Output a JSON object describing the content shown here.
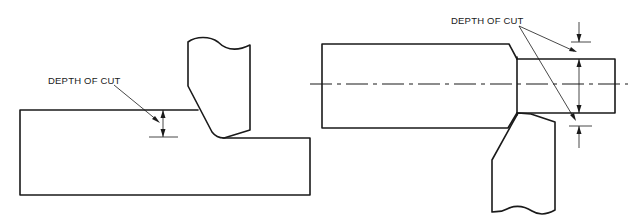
{
  "diagram": {
    "colors": {
      "line": "#1a1a1a",
      "background": "#ffffff"
    },
    "left_view": {
      "description": "Facing / shaping operation on a flat workpiece",
      "label": "DEPTH OF CUT",
      "parts": [
        "workpiece-block",
        "cutting-tool",
        "depth-dimension"
      ]
    },
    "right_view": {
      "description": "Turning operation on a cylindrical workpiece with centerline",
      "label": "DEPTH OF CUT",
      "parts": [
        "large-diameter-section",
        "turned-small-diameter-section",
        "centerline",
        "cutting-tool",
        "depth-dimension-top",
        "depth-dimension-bottom"
      ]
    }
  }
}
